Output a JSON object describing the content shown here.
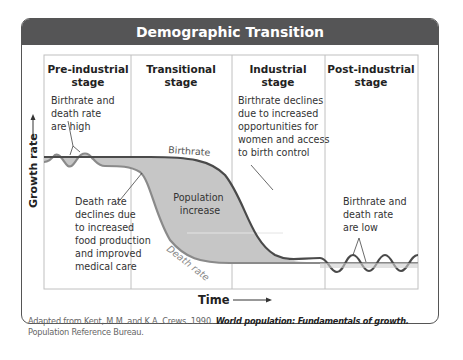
{
  "title": "Demographic Transition",
  "stages": [
    {
      "line1": "Pre-industrial",
      "line2": "stage"
    },
    {
      "line1": "Transitional",
      "line2": "stage"
    },
    {
      "line1": "Industrial",
      "line2": "stage"
    },
    {
      "line1": "Post-industrial",
      "line2": "stage"
    }
  ],
  "axes": {
    "y_label": "Growth rate",
    "x_label": "Time"
  },
  "annotations": {
    "pre_industrial": [
      "Birthrate and",
      "death rate",
      "are high"
    ],
    "death_decline": [
      "Death rate",
      "declines due",
      "to increased",
      "food production",
      "and improved",
      "medical care"
    ],
    "birth_decline": [
      "Birthrate declines",
      "due to increased",
      "opportunities for",
      "women and access",
      "to birth control"
    ],
    "post_industrial": [
      "Birthrate and",
      "death rate",
      "are low"
    ],
    "population_increase": [
      "Population",
      "increase"
    ]
  },
  "curve_labels": {
    "birthrate": "Birthrate",
    "death_rate": "Death rate"
  },
  "caption": {
    "prefix": "Adapted from Kent, M.M. and K.A. Crews. 1990. ",
    "title": "World population: Fundamentals of growth.",
    "suffix": " Population Reference Bureau."
  },
  "colors": {
    "header_bg": "#555556",
    "curve": "#4a4a4a",
    "fill": "#c6c6c6",
    "grid": "#b8b8b8",
    "death_label": "#888888"
  }
}
